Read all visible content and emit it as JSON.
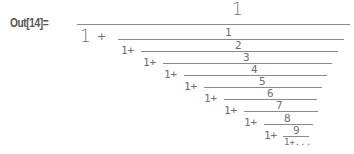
{
  "cell": {
    "output_label": "Out[14]=",
    "expression": "continued fraction 1/(1+1/(1+2/(1+3/(1+4/(1+5/(1+6/(1+7/(1+8/(1+9/(1+...))))))))))"
  },
  "fraction": {
    "top_numerator": "1",
    "top_denominator_one": "1",
    "top_plus": "+",
    "levels": [
      {
        "numerator": "1",
        "prefix": "1+"
      },
      {
        "numerator": "2",
        "prefix": "1+"
      },
      {
        "numerator": "3",
        "prefix": "1+"
      },
      {
        "numerator": "4",
        "prefix": "1+"
      },
      {
        "numerator": "5",
        "prefix": "1+"
      },
      {
        "numerator": "6",
        "prefix": "1+"
      },
      {
        "numerator": "7",
        "prefix": "1+"
      },
      {
        "numerator": "8",
        "prefix": "1+"
      },
      {
        "numerator": "9",
        "prefix": "1+"
      }
    ],
    "tail": "1+..."
  },
  "colors": {
    "text": "#6e6e6e",
    "label": "#555555",
    "rule": "#8a8a8a",
    "background": "#ffffff"
  }
}
